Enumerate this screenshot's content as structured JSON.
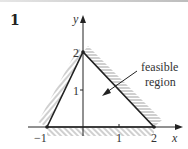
{
  "question_number": "1",
  "axes": {
    "x_label": "x",
    "y_label": "y",
    "x_ticks": [
      "−1",
      "1",
      "2"
    ],
    "y_ticks": [
      "1",
      "2"
    ]
  },
  "annotation": {
    "line1": "feasible",
    "line2": "region"
  },
  "vertices": [
    {
      "x": -1,
      "y": 0
    },
    {
      "x": 0,
      "y": 2
    },
    {
      "x": 2,
      "y": 0
    }
  ],
  "colors": {
    "line": "#222222",
    "hatch": "#777777"
  }
}
